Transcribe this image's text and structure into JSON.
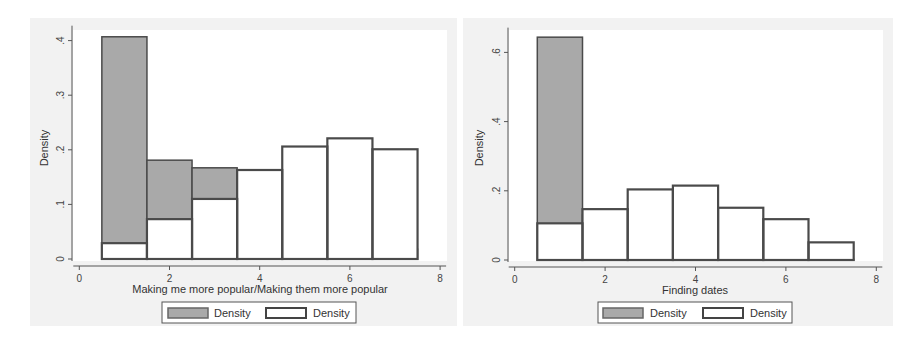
{
  "colors": {
    "panel_bg": "#f1f1f1",
    "plot_bg": "#ffffff",
    "gray_fill": "#a9a9a9",
    "outline": "#4a4a4a",
    "white_fill": "#ffffff"
  },
  "chart_data": [
    {
      "type": "bar",
      "subtype": "overlaid-histogram",
      "title": "",
      "xlabel": "Making me more popular/Making them more popular",
      "ylabel": "Density",
      "xlim": [
        0,
        8
      ],
      "ylim": [
        0,
        0.42
      ],
      "xticks": [
        0,
        2,
        4,
        6,
        8
      ],
      "xtick_labels": [
        "0",
        "2",
        "4",
        "6",
        "8"
      ],
      "yticks": [
        0,
        0.1,
        0.2,
        0.3,
        0.4
      ],
      "ytick_labels": [
        "0",
        ".1",
        ".2",
        ".3",
        ".4"
      ],
      "categories": [
        1,
        2,
        3,
        4,
        5,
        6,
        7
      ],
      "bin_width": 1,
      "grid": false,
      "legend_position": "bottom",
      "series": [
        {
          "name": "Density",
          "style": "gray",
          "values": [
            0.407,
            0.181,
            0.167,
            0.114,
            0.066,
            0.041,
            0.018
          ]
        },
        {
          "name": "Density",
          "style": "white",
          "values": [
            0.029,
            0.073,
            0.11,
            0.163,
            0.206,
            0.221,
            0.201
          ]
        }
      ]
    },
    {
      "type": "bar",
      "subtype": "overlaid-histogram",
      "title": "",
      "xlabel": "Finding dates",
      "ylabel": "Density",
      "xlim": [
        0,
        8
      ],
      "ylim": [
        0,
        0.66
      ],
      "xticks": [
        0,
        2,
        4,
        6,
        8
      ],
      "xtick_labels": [
        "0",
        "2",
        "4",
        "6",
        "8"
      ],
      "yticks": [
        0,
        0.2,
        0.4,
        0.6
      ],
      "ytick_labels": [
        "0",
        ".2",
        ".4",
        ".6"
      ],
      "categories": [
        1,
        2,
        3,
        4,
        5,
        6,
        7
      ],
      "bin_width": 1,
      "grid": false,
      "legend_position": "bottom",
      "series": [
        {
          "name": "Density",
          "style": "gray",
          "values": [
            0.644,
            0.13,
            0.093,
            0.075,
            0.021,
            0.021,
            0.002
          ]
        },
        {
          "name": "Density",
          "style": "white",
          "values": [
            0.106,
            0.147,
            0.204,
            0.215,
            0.151,
            0.118,
            0.051
          ]
        }
      ]
    }
  ],
  "charts": [
    {
      "xlabel": "Making me more popular/Making them more popular",
      "ylabel": "Density",
      "legend": {
        "item1": "Density",
        "item2": "Density"
      }
    },
    {
      "xlabel": "Finding dates",
      "ylabel": "Density",
      "legend": {
        "item1": "Density",
        "item2": "Density"
      }
    }
  ]
}
